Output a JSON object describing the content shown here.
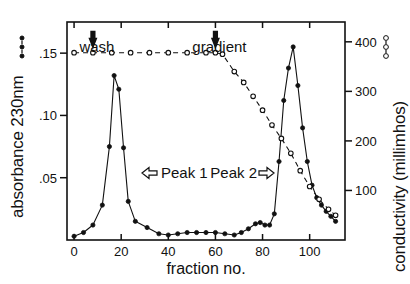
{
  "figure": {
    "background": "#ffffff",
    "ink": "#111111"
  },
  "axes": {
    "left": {
      "label": "absorbance 230nm",
      "marker_legend": "filled-circle-dash",
      "ticks": [
        ".05",
        ".10",
        ".15"
      ],
      "tick_values": [
        0.05,
        0.1,
        0.15
      ],
      "range": [
        0.0,
        0.175
      ]
    },
    "right": {
      "label": "conductivity (millimhos)",
      "marker_legend": "open-circle-dash",
      "ticks": [
        "100",
        "200",
        "300",
        "400"
      ],
      "tick_values": [
        100,
        200,
        300,
        400
      ],
      "range": [
        0,
        440
      ]
    },
    "bottom": {
      "label": "fraction no.",
      "ticks": [
        "0",
        "20",
        "40",
        "60",
        "80",
        "100"
      ],
      "tick_values": [
        0,
        20,
        40,
        60,
        80,
        100
      ],
      "range": [
        -3,
        115
      ]
    },
    "top": {
      "ticks_only": true
    }
  },
  "annotations": [
    {
      "name": "wash-label",
      "text": "wash",
      "x": 8,
      "arrow": "down"
    },
    {
      "name": "gradient-label",
      "text": "gradient",
      "x": 60,
      "arrow": "down"
    },
    {
      "name": "peak1-label",
      "text": "Peak 1",
      "arrow": "left"
    },
    {
      "name": "peak2-label",
      "text": "Peak 2",
      "arrow": "right"
    }
  ],
  "chart_data": {
    "type": "line",
    "title": "",
    "xlabel": "fraction no.",
    "ylabel": "absorbance 230nm",
    "y2label": "conductivity (millimhos)",
    "xlim": [
      -3,
      115
    ],
    "ylim": [
      0,
      0.175
    ],
    "y2lim": [
      0,
      440
    ],
    "grid": false,
    "legend": "none",
    "annotations": [
      "wash",
      "gradient",
      "Peak 1",
      "Peak 2"
    ],
    "series": [
      {
        "name": "absorbance 230nm",
        "axis": "left",
        "marker": "filled-circle",
        "linestyle": "solid",
        "points": [
          [
            0,
            0.003
          ],
          [
            4,
            0.006
          ],
          [
            8,
            0.012
          ],
          [
            12,
            0.028
          ],
          [
            15,
            0.075
          ],
          [
            17,
            0.132
          ],
          [
            19,
            0.121
          ],
          [
            21,
            0.074
          ],
          [
            23,
            0.031
          ],
          [
            26,
            0.015
          ],
          [
            31,
            0.01
          ],
          [
            36,
            0.005
          ],
          [
            40,
            0.004
          ],
          [
            44,
            0.005
          ],
          [
            48,
            0.006
          ],
          [
            52,
            0.006
          ],
          [
            56,
            0.006
          ],
          [
            60,
            0.006
          ],
          [
            64,
            0.005
          ],
          [
            68,
            0.004
          ],
          [
            71,
            0.006
          ],
          [
            74,
            0.009
          ],
          [
            77,
            0.013
          ],
          [
            79,
            0.014
          ],
          [
            81,
            0.012
          ],
          [
            83,
            0.012
          ],
          [
            85,
            0.021
          ],
          [
            87,
            0.063
          ],
          [
            89,
            0.112
          ],
          [
            91,
            0.138
          ],
          [
            93,
            0.155
          ],
          [
            95,
            0.124
          ],
          [
            97,
            0.09
          ],
          [
            99,
            0.063
          ],
          [
            101,
            0.044
          ],
          [
            103,
            0.034
          ],
          [
            105,
            0.028
          ],
          [
            107,
            0.023
          ],
          [
            109,
            0.019
          ],
          [
            111,
            0.015
          ]
        ]
      },
      {
        "name": "conductivity (millimhos)",
        "axis": "right",
        "marker": "open-circle",
        "linestyle": "dashed",
        "points": [
          [
            0,
            378
          ],
          [
            8,
            378
          ],
          [
            16,
            378
          ],
          [
            24,
            378
          ],
          [
            32,
            378
          ],
          [
            40,
            378
          ],
          [
            48,
            378
          ],
          [
            56,
            378
          ],
          [
            60,
            378
          ],
          [
            63,
            375
          ],
          [
            68,
            340
          ],
          [
            72,
            318
          ],
          [
            76,
            290
          ],
          [
            80,
            262
          ],
          [
            84,
            232
          ],
          [
            88,
            205
          ],
          [
            92,
            175
          ],
          [
            96,
            140
          ],
          [
            100,
            108
          ],
          [
            104,
            82
          ],
          [
            108,
            62
          ],
          [
            111,
            50
          ]
        ]
      }
    ]
  }
}
